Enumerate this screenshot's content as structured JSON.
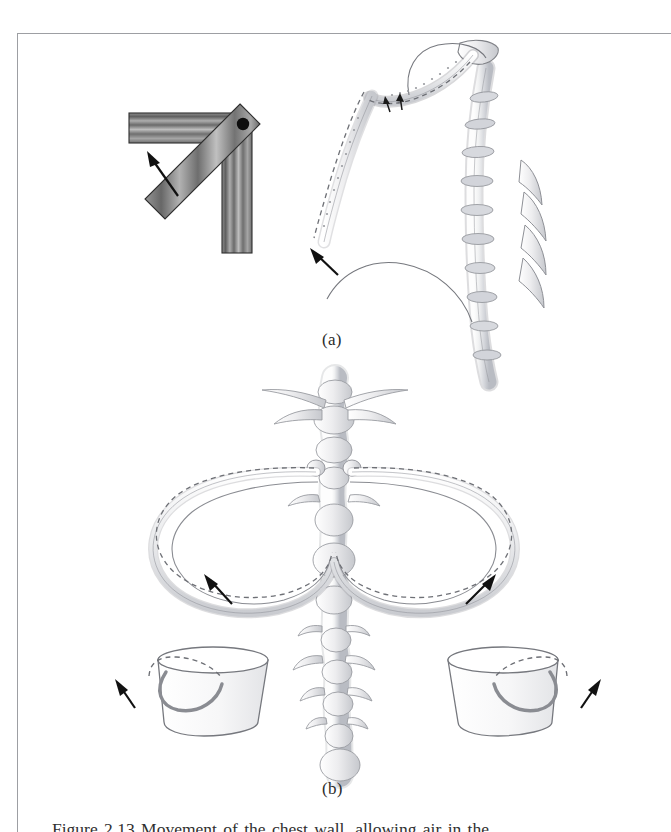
{
  "page": {
    "background_color": "#ffffff",
    "border_color": "#9d9fa3",
    "ink_color": "#2f2f2f"
  },
  "figure": {
    "panels": [
      {
        "id": "a",
        "label": "(a)",
        "subject": "pump-handle rib movement with hinge analogy",
        "parts": [
          {
            "name": "hinge-mechanism-diagram",
            "description": "two hatched bars joined at a pivot, one rotated upward",
            "pivot_marker": "black-dot",
            "arrow_direction": "up-left"
          },
          {
            "name": "lateral-ribcage-illustration",
            "description": "sternum, upper rib, vertebral column with ribs; dashed outline shows elevated position",
            "arrow_direction": "up-left"
          }
        ]
      },
      {
        "id": "b",
        "label": "(b)",
        "subject": "bucket-handle rib movement with bucket analogy",
        "parts": [
          {
            "name": "anterior-ribcage-illustration",
            "description": "vertebral column with paired ribs, dashed outline shows elevated position",
            "arrow_direction_left": "up-left",
            "arrow_direction_right": "up-right"
          },
          {
            "name": "bucket-handle-left",
            "description": "bucket with handle swinging upward, dashed arc shows raised handle",
            "arrow_direction": "up-left"
          },
          {
            "name": "bucket-handle-right",
            "description": "bucket with handle swinging upward, dashed arc shows raised handle",
            "arrow_direction": "up-right"
          }
        ]
      }
    ]
  },
  "caption": {
    "text": "Figure 2.13  Movement of the chest wall, allowing air in the ...",
    "visible_state": "clipped-at-page-bottom"
  },
  "colors": {
    "bar_dark": "#5c5c5c",
    "bar_light": "#b4b4b4",
    "bone_fill": "#f4f4f5",
    "bone_stroke": "#8e9096",
    "bone_shade": "#c9cbd0",
    "arrow": "#111111",
    "dash": "#6e7076"
  }
}
